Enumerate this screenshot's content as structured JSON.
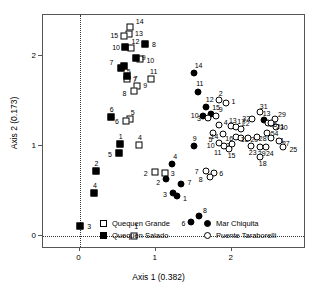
{
  "chart_data": {
    "type": "scatter",
    "title": "",
    "xlabel": "Axis 1 (0.382)",
    "ylabel": "Axis 2 (0.173)",
    "xlim": [
      -0.48,
      2.95
    ],
    "ylim": [
      -0.12,
      2.45
    ],
    "xticks": [
      0,
      1,
      2
    ],
    "xticklabels": [
      "0",
      "1",
      "2"
    ],
    "yticks": [
      0,
      1,
      2
    ],
    "yticklabels": [
      "0",
      "1",
      "2"
    ],
    "grid": false,
    "zero_reference_lines": {
      "vertical_x": 0,
      "horizontal_y": 0,
      "style": "dotted"
    },
    "legend_position": "inside-bottom-center",
    "series": [
      {
        "name": "Quequen Grande",
        "marker": "open-square",
        "points": [
          {
            "label": "14",
            "x": 0.66,
            "y": 2.32,
            "lx": 6,
            "ly": -9
          },
          {
            "label": "13",
            "x": 0.65,
            "y": 2.24,
            "lx": 6,
            "ly": -4
          },
          {
            "label": "15",
            "x": 0.59,
            "y": 2.22,
            "lx": -14,
            "ly": -4
          },
          {
            "label": "12",
            "x": 0.67,
            "y": 2.08,
            "lx": 1,
            "ly": -10
          },
          {
            "label": "10",
            "x": 0.8,
            "y": 1.96,
            "lx": 6,
            "ly": -2
          },
          {
            "label": "7",
            "x": 0.62,
            "y": 1.74,
            "lx": 6,
            "ly": -3
          },
          {
            "label": "9",
            "x": 0.76,
            "y": 1.66,
            "lx": 6,
            "ly": -4
          },
          {
            "label": "8",
            "x": 0.71,
            "y": 1.61,
            "lx": -11,
            "ly": -1
          },
          {
            "label": "5",
            "x": 0.66,
            "y": 1.3,
            "lx": 1,
            "ly": -10
          },
          {
            "label": "6",
            "x": 0.61,
            "y": 1.28,
            "lx": -11,
            "ly": -3
          },
          {
            "label": "11",
            "x": 0.94,
            "y": 1.74,
            "lx": -1,
            "ly": -11
          },
          {
            "label": "4",
            "x": 0.78,
            "y": 1.01,
            "lx": -1,
            "ly": -11
          },
          {
            "label": "2",
            "x": 0.99,
            "y": 0.71,
            "lx": -11,
            "ly": -2
          },
          {
            "label": "3",
            "x": 1.12,
            "y": 0.7,
            "lx": 6,
            "ly": -3
          },
          {
            "label": "1",
            "x": 0.72,
            "y": 0.0,
            "lx": 0,
            "ly": -13
          }
        ]
      },
      {
        "name": "Quequen Salado",
        "marker": "filled-square",
        "points": [
          {
            "label": "8",
            "x": 0.86,
            "y": 2.13,
            "lx": 7,
            "ly": -3
          },
          {
            "label": "10",
            "x": 0.6,
            "y": 2.1,
            "lx": -13,
            "ly": -3
          },
          {
            "label": "9",
            "x": 0.74,
            "y": 1.97,
            "lx": 6,
            "ly": -4
          },
          {
            "label": "5",
            "x": 0.58,
            "y": 1.89,
            "lx": 3,
            "ly": 2
          },
          {
            "label": "7",
            "x": 0.54,
            "y": 1.86,
            "lx": -11,
            "ly": -9
          },
          {
            "label": "7",
            "x": 0.62,
            "y": 1.77,
            "lx": 7,
            "ly": -1
          },
          {
            "label": "6",
            "x": 0.41,
            "y": 1.32,
            "lx": -1,
            "ly": -11
          },
          {
            "label": "1",
            "x": 0.53,
            "y": 1.02,
            "lx": -1,
            "ly": -11
          },
          {
            "label": "5",
            "x": 0.52,
            "y": 0.92,
            "lx": -11,
            "ly": -2
          },
          {
            "label": "2",
            "x": 0.21,
            "y": 0.72,
            "lx": -1,
            "ly": -11
          },
          {
            "label": "4",
            "x": 0.19,
            "y": 0.48,
            "lx": -1,
            "ly": -11
          },
          {
            "label": "3",
            "x": 0.01,
            "y": 0.11,
            "lx": 7,
            "ly": -3
          }
        ]
      },
      {
        "name": "Mar Chiquita",
        "marker": "filled-circle",
        "points": [
          {
            "label": "14",
            "x": 1.5,
            "y": 1.81,
            "lx": 1,
            "ly": -11
          },
          {
            "label": "11",
            "x": 1.56,
            "y": 1.6,
            "lx": -2,
            "ly": -12
          },
          {
            "label": "12",
            "x": 1.66,
            "y": 1.43,
            "lx": 0,
            "ly": -11
          },
          {
            "label": "10",
            "x": 1.62,
            "y": 1.33,
            "lx": -12,
            "ly": -4
          },
          {
            "label": "15",
            "x": 1.73,
            "y": 1.35,
            "lx": 1,
            "ly": -10
          },
          {
            "label": "9",
            "x": 1.5,
            "y": 1.0,
            "lx": -1,
            "ly": -11
          },
          {
            "label": "4",
            "x": 1.22,
            "y": 0.8,
            "lx": 1,
            "ly": -11
          },
          {
            "label": "2",
            "x": 1.14,
            "y": 0.63,
            "lx": -10,
            "ly": 0
          },
          {
            "label": "3",
            "x": 1.23,
            "y": 0.48,
            "lx": -10,
            "ly": -2
          },
          {
            "label": "1",
            "x": 1.28,
            "y": 0.44,
            "lx": 6,
            "ly": -1
          },
          {
            "label": "7",
            "x": 1.34,
            "y": 0.58,
            "lx": 6,
            "ly": -5
          },
          {
            "label": "6",
            "x": 1.47,
            "y": 0.16,
            "lx": -10,
            "ly": -2
          },
          {
            "label": "8",
            "x": 1.57,
            "y": 0.22,
            "lx": 4,
            "ly": -9
          },
          {
            "label": "13",
            "x": 2.42,
            "y": 1.29,
            "lx": -1,
            "ly": -10
          }
        ]
      },
      {
        "name": "Puente Taraborelli",
        "marker": "open-circle",
        "points": [
          {
            "label": "2",
            "x": 1.83,
            "y": 1.51,
            "lx": 0,
            "ly": -10
          },
          {
            "label": "1",
            "x": 1.92,
            "y": 1.48,
            "lx": 6,
            "ly": -5
          },
          {
            "label": "9",
            "x": 1.79,
            "y": 1.33,
            "lx": 3,
            "ly": -10
          },
          {
            "label": "3",
            "x": 1.69,
            "y": 1.31,
            "lx": -11,
            "ly": -3
          },
          {
            "label": "4",
            "x": 1.83,
            "y": 1.23,
            "lx": 5,
            "ly": -6
          },
          {
            "label": "5",
            "x": 1.76,
            "y": 1.14,
            "lx": -5,
            "ly": 3
          },
          {
            "label": "14",
            "x": 1.88,
            "y": 1.13,
            "lx": -12,
            "ly": -1
          },
          {
            "label": "13",
            "x": 1.99,
            "y": 1.22,
            "lx": -2,
            "ly": -9
          },
          {
            "label": "17",
            "x": 2.06,
            "y": 1.21,
            "lx": 1,
            "ly": -9
          },
          {
            "label": "22",
            "x": 2.12,
            "y": 1.19,
            "lx": 1,
            "ly": -9
          },
          {
            "label": "32",
            "x": 2.27,
            "y": 1.3,
            "lx": -10,
            "ly": -4
          },
          {
            "label": "31",
            "x": 2.37,
            "y": 1.38,
            "lx": 0,
            "ly": -9
          },
          {
            "label": "29",
            "x": 2.57,
            "y": 1.3,
            "lx": 3,
            "ly": -8
          },
          {
            "label": "30",
            "x": 2.58,
            "y": 1.21,
            "lx": 4,
            "ly": -3
          },
          {
            "label": "26",
            "x": 2.48,
            "y": 1.25,
            "lx": 1,
            "ly": -2
          },
          {
            "label": "21",
            "x": 2.52,
            "y": 1.25,
            "lx": 5,
            "ly": 0
          },
          {
            "label": "16",
            "x": 2.06,
            "y": 1.1,
            "lx": -11,
            "ly": -2
          },
          {
            "label": "18",
            "x": 2.12,
            "y": 1.09,
            "lx": 0,
            "ly": -2
          },
          {
            "label": "20",
            "x": 2.22,
            "y": 1.09,
            "lx": 2,
            "ly": -2
          },
          {
            "label": "28",
            "x": 2.33,
            "y": 1.1,
            "lx": 2,
            "ly": -2
          },
          {
            "label": "54",
            "x": 2.46,
            "y": 1.14,
            "lx": 4,
            "ly": -3
          },
          {
            "label": "51",
            "x": 2.52,
            "y": 1.09,
            "lx": 5,
            "ly": -1
          },
          {
            "label": "27",
            "x": 2.62,
            "y": 1.05,
            "lx": 3,
            "ly": -1
          },
          {
            "label": "25",
            "x": 2.68,
            "y": 0.99,
            "lx": 6,
            "ly": -1
          },
          {
            "label": "12",
            "x": 2.01,
            "y": 1.02,
            "lx": -10,
            "ly": -2
          },
          {
            "label": "15",
            "x": 1.96,
            "y": 0.97,
            "lx": -1,
            "ly": 3
          },
          {
            "label": "11",
            "x": 1.9,
            "y": 1.0,
            "lx": -10,
            "ly": 3
          },
          {
            "label": "10",
            "x": 1.83,
            "y": 1.03,
            "lx": -12,
            "ly": -1
          },
          {
            "label": "23",
            "x": 2.25,
            "y": 1.0,
            "lx": -2,
            "ly": 3
          },
          {
            "label": "29",
            "x": 2.37,
            "y": 0.99,
            "lx": -2,
            "ly": 3
          },
          {
            "label": "24",
            "x": 2.45,
            "y": 0.99,
            "lx": 0,
            "ly": 3
          },
          {
            "label": "18",
            "x": 2.37,
            "y": 0.88,
            "lx": -1,
            "ly": 3
          },
          {
            "label": "7",
            "x": 1.66,
            "y": 0.72,
            "lx": -11,
            "ly": -3
          },
          {
            "label": "6",
            "x": 1.77,
            "y": 0.7,
            "lx": 5,
            "ly": -3
          },
          {
            "label": "8",
            "x": 1.71,
            "y": 0.66,
            "lx": -11,
            "ly": -1
          }
        ]
      }
    ]
  },
  "legend": {
    "items": [
      {
        "label": "Quequen Grande",
        "marker": "open-square"
      },
      {
        "label": "Quequen Salado",
        "marker": "filled-square"
      },
      {
        "label": "Mar Chiquita",
        "marker": "filled-circle"
      },
      {
        "label": "Puente Taraborelli",
        "marker": "open-circle"
      }
    ]
  }
}
